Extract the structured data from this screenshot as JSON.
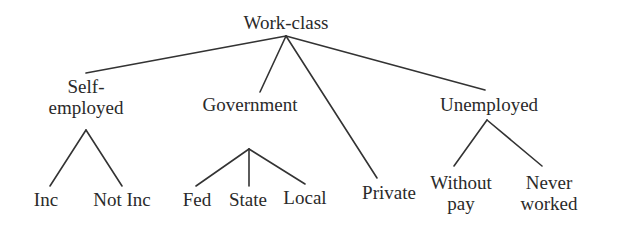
{
  "diagram": {
    "type": "tree",
    "root": {
      "label": "Work-class",
      "children": [
        {
          "label": "Self-\nemployed",
          "line1": "Self-",
          "line2": "employed",
          "children": [
            {
              "label": "Inc"
            },
            {
              "label": "Not Inc"
            }
          ]
        },
        {
          "label": "Government",
          "children": [
            {
              "label": "Fed"
            },
            {
              "label": "State"
            },
            {
              "label": "Local"
            }
          ]
        },
        {
          "label": "Private"
        },
        {
          "label": "Unemployed",
          "children": [
            {
              "label": "Without\npay",
              "line1": "Without",
              "line2": "pay"
            },
            {
              "label": "Never\nworked",
              "line1": "Never",
              "line2": "worked"
            }
          ]
        }
      ]
    },
    "line_color": "#333333",
    "text_color": "#2a2a2a"
  }
}
